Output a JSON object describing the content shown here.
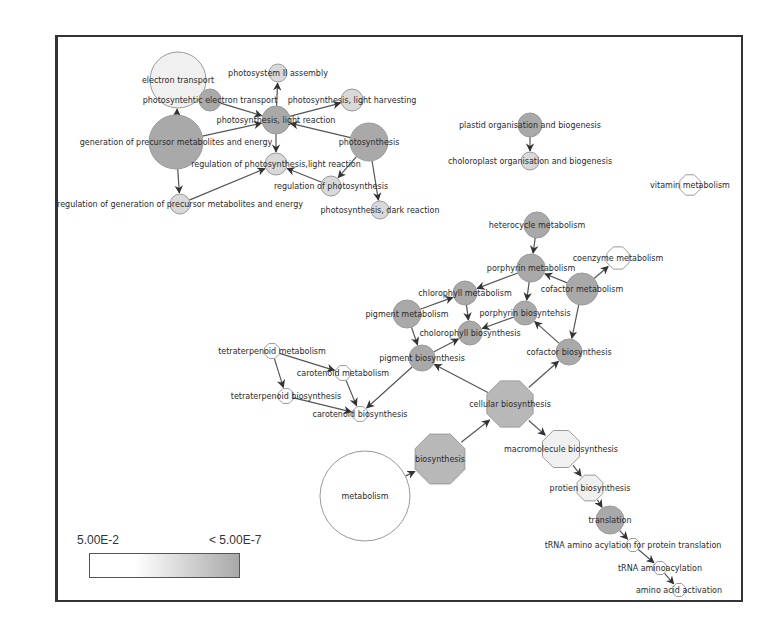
{
  "legend": {
    "low_label": "5.00E-2",
    "high_label": "< 5.00E-7",
    "gradient_start": "#ffffff",
    "gradient_end": "#a8a8a8"
  },
  "colors": {
    "white": "#ffffff",
    "very_light": "#f0f0f0",
    "light": "#d9d9d9",
    "medium": "#b8b8b8",
    "dark": "#a9a9a9"
  },
  "nodes": [
    {
      "id": "electron_transport",
      "label": "electron transport",
      "x": 178,
      "y": 80,
      "r": 28,
      "shade": "very_light",
      "shape": "circle"
    },
    {
      "id": "photosystem_ii_assembly",
      "label": "photosystem II assembly",
      "x": 278,
      "y": 73,
      "r": 9,
      "shade": "light",
      "shape": "circle"
    },
    {
      "id": "photosynthetic_electron_transport",
      "label": "photosyntehtic electron transport",
      "x": 210,
      "y": 100,
      "r": 11,
      "shade": "dark",
      "shape": "circle"
    },
    {
      "id": "photosynthesis_light_harvesting",
      "label": "photosynthesis, light harvesting",
      "x": 352,
      "y": 100,
      "r": 11,
      "shade": "light",
      "shape": "circle"
    },
    {
      "id": "photosynthesis_light_reaction",
      "label": "photosynthesis, light reaction",
      "x": 276,
      "y": 120,
      "r": 14,
      "shade": "dark",
      "shape": "circle"
    },
    {
      "id": "generation_precursor",
      "label": "generation of precursor metabolites and energy",
      "x": 176,
      "y": 142,
      "r": 27,
      "shade": "dark",
      "shape": "circle"
    },
    {
      "id": "photosynthesis",
      "label": "photosynthesis",
      "x": 369,
      "y": 142,
      "r": 19,
      "shade": "dark",
      "shape": "circle"
    },
    {
      "id": "regulation_photosynthesis_light",
      "label": "regulation of photosynthesis,light reaction",
      "x": 276,
      "y": 164,
      "r": 11,
      "shade": "light",
      "shape": "circle"
    },
    {
      "id": "regulation_photosynthesis",
      "label": "regulation of photosynthesis",
      "x": 331,
      "y": 186,
      "r": 10,
      "shade": "light",
      "shape": "circle"
    },
    {
      "id": "regulation_generation_precursor",
      "label": "regulation of generation of precursor metabolites and energy",
      "x": 180,
      "y": 204,
      "r": 10,
      "shade": "light",
      "shape": "circle"
    },
    {
      "id": "photosynthesis_dark_reaction",
      "label": "photosynthesis, dark reaction",
      "x": 380,
      "y": 210,
      "r": 9,
      "shade": "light",
      "shape": "circle"
    },
    {
      "id": "plastid_organisation",
      "label": "plastid organisation and biogenesis",
      "x": 530,
      "y": 125,
      "r": 12,
      "shade": "dark",
      "shape": "circle"
    },
    {
      "id": "chloroplast_organisation",
      "label": "choloroplast organisation and biogenesis",
      "x": 530,
      "y": 161,
      "r": 9,
      "shade": "light",
      "shape": "circle"
    },
    {
      "id": "vitamin_metabolism",
      "label": "vitamin metabolism",
      "x": 690,
      "y": 185,
      "r": 11,
      "shade": "white",
      "shape": "octagon"
    },
    {
      "id": "heterocycle_metabolism",
      "label": "heterocycle metabolism",
      "x": 537,
      "y": 225,
      "r": 13,
      "shade": "dark",
      "shape": "circle"
    },
    {
      "id": "porphyrin_metabolism",
      "label": "porphyrin metabolism",
      "x": 531,
      "y": 268,
      "r": 14,
      "shade": "dark",
      "shape": "circle"
    },
    {
      "id": "coenzyme_metabolism",
      "label": "coenzyme metabolism",
      "x": 618,
      "y": 258,
      "r": 12,
      "shade": "white",
      "shape": "octagon"
    },
    {
      "id": "cofactor_metabolism",
      "label": "cofactor metabolism",
      "x": 582,
      "y": 289,
      "r": 16,
      "shade": "dark",
      "shape": "circle"
    },
    {
      "id": "chlorophyll_metabolism",
      "label": "chlorophyll metabolism",
      "x": 465,
      "y": 293,
      "r": 12,
      "shade": "dark",
      "shape": "circle"
    },
    {
      "id": "pigment_metabolism",
      "label": "pigment metabolism",
      "x": 407,
      "y": 314,
      "r": 14,
      "shade": "dark",
      "shape": "circle"
    },
    {
      "id": "porphyrin_biosynthesis",
      "label": "porphyrin biosyntehsis",
      "x": 525,
      "y": 313,
      "r": 12,
      "shade": "dark",
      "shape": "circle"
    },
    {
      "id": "chlorophyll_biosynthesis",
      "label": "cholorophyll biosynthesis",
      "x": 470,
      "y": 333,
      "r": 12,
      "shade": "dark",
      "shape": "circle"
    },
    {
      "id": "cofactor_biosynthesis",
      "label": "cofactor biosynthesis",
      "x": 569,
      "y": 352,
      "r": 13,
      "shade": "dark",
      "shape": "circle"
    },
    {
      "id": "pigment_biosynthesis",
      "label": "pigment biosynthesis",
      "x": 422,
      "y": 358,
      "r": 13,
      "shade": "dark",
      "shape": "circle"
    },
    {
      "id": "tetraterpenoid_metabolism",
      "label": "tetraterpenoid metabolism",
      "x": 272,
      "y": 351,
      "r": 8,
      "shade": "white",
      "shape": "octagon"
    },
    {
      "id": "carotenoid_metabolism",
      "label": "carotenoid metabolism",
      "x": 343,
      "y": 373,
      "r": 8,
      "shade": "white",
      "shape": "octagon"
    },
    {
      "id": "tetraterpenoid_biosynthesis",
      "label": "tetraterpenoid biosynthesis",
      "x": 286,
      "y": 396,
      "r": 8,
      "shade": "white",
      "shape": "octagon"
    },
    {
      "id": "carotenoid_biosynthesis",
      "label": "carotenoid biosynthesis",
      "x": 360,
      "y": 414,
      "r": 8,
      "shade": "white",
      "shape": "octagon"
    },
    {
      "id": "cellular_biosynthesis",
      "label": "cellular biosynthesis",
      "x": 510,
      "y": 404,
      "r": 25,
      "shade": "medium",
      "shape": "octagon"
    },
    {
      "id": "macromolecule_biosynthesis",
      "label": "macromolecule biosynthesis",
      "x": 561,
      "y": 449,
      "r": 20,
      "shade": "very_light",
      "shape": "octagon"
    },
    {
      "id": "biosynthesis",
      "label": "biosynthesis",
      "x": 440,
      "y": 459,
      "r": 27,
      "shade": "medium",
      "shape": "octagon"
    },
    {
      "id": "metabolism",
      "label": "metabolism",
      "x": 365,
      "y": 496,
      "r": 45,
      "shade": "white",
      "shape": "circle"
    },
    {
      "id": "protein_biosynthesis",
      "label": "protien biosynthesis",
      "x": 590,
      "y": 488,
      "r": 14,
      "shade": "very_light",
      "shape": "octagon"
    },
    {
      "id": "translation",
      "label": "translation",
      "x": 610,
      "y": 520,
      "r": 14,
      "shade": "dark",
      "shape": "circle"
    },
    {
      "id": "trna_aminoacylation_translation",
      "label": "tRNA amino acylation for protein translation",
      "x": 633,
      "y": 545,
      "r": 7,
      "shade": "white",
      "shape": "octagon"
    },
    {
      "id": "trna_aminoacylation",
      "label": "tRNA aminoacylation",
      "x": 660,
      "y": 568,
      "r": 7,
      "shade": "white",
      "shape": "octagon"
    },
    {
      "id": "amino_acid_activation",
      "label": "amino acid activation",
      "x": 679,
      "y": 590,
      "r": 7,
      "shade": "white",
      "shape": "octagon"
    }
  ],
  "edges": [
    [
      "generation_precursor",
      "electron_transport"
    ],
    [
      "electron_transport",
      "photosynthetic_electron_transport"
    ],
    [
      "photosynthetic_electron_transport",
      "photosynthesis_light_reaction"
    ],
    [
      "generation_precursor",
      "photosynthesis_light_reaction"
    ],
    [
      "photosynthesis_light_reaction",
      "photosystem_ii_assembly"
    ],
    [
      "photosynthesis_light_reaction",
      "photosynthesis_light_harvesting"
    ],
    [
      "photosynthesis",
      "photosynthesis_light_reaction"
    ],
    [
      "photosynthesis_light_reaction",
      "regulation_photosynthesis_light"
    ],
    [
      "generation_precursor",
      "regulation_generation_precursor"
    ],
    [
      "regulation_generation_precursor",
      "regulation_photosynthesis_light"
    ],
    [
      "regulation_photosynthesis",
      "regulation_photosynthesis_light"
    ],
    [
      "photosynthesis",
      "regulation_photosynthesis"
    ],
    [
      "photosynthesis",
      "photosynthesis_dark_reaction"
    ],
    [
      "plastid_organisation",
      "chloroplast_organisation"
    ],
    [
      "heterocycle_metabolism",
      "porphyrin_metabolism"
    ],
    [
      "porphyrin_metabolism",
      "chlorophyll_metabolism"
    ],
    [
      "porphyrin_metabolism",
      "porphyrin_biosynthesis"
    ],
    [
      "cofactor_metabolism",
      "porphyrin_metabolism"
    ],
    [
      "cofactor_metabolism",
      "coenzyme_metabolism"
    ],
    [
      "cofactor_metabolism",
      "cofactor_biosynthesis"
    ],
    [
      "pigment_metabolism",
      "chlorophyll_metabolism"
    ],
    [
      "chlorophyll_metabolism",
      "chlorophyll_biosynthesis"
    ],
    [
      "porphyrin_biosynthesis",
      "chlorophyll_biosynthesis"
    ],
    [
      "pigment_metabolism",
      "pigment_biosynthesis"
    ],
    [
      "pigment_biosynthesis",
      "chlorophyll_biosynthesis"
    ],
    [
      "cofactor_biosynthesis",
      "porphyrin_biosynthesis"
    ],
    [
      "cellular_biosynthesis",
      "cofactor_biosynthesis"
    ],
    [
      "cellular_biosynthesis",
      "pigment_biosynthesis"
    ],
    [
      "pigment_biosynthesis",
      "carotenoid_biosynthesis"
    ],
    [
      "tetraterpenoid_metabolism",
      "carotenoid_metabolism"
    ],
    [
      "tetraterpenoid_metabolism",
      "tetraterpenoid_biosynthesis"
    ],
    [
      "carotenoid_metabolism",
      "carotenoid_biosynthesis"
    ],
    [
      "tetraterpenoid_biosynthesis",
      "carotenoid_biosynthesis"
    ],
    [
      "biosynthesis",
      "cellular_biosynthesis"
    ],
    [
      "metabolism",
      "biosynthesis"
    ],
    [
      "cellular_biosynthesis",
      "macromolecule_biosynthesis"
    ],
    [
      "macromolecule_biosynthesis",
      "protein_biosynthesis"
    ],
    [
      "protein_biosynthesis",
      "translation"
    ],
    [
      "translation",
      "trna_aminoacylation_translation"
    ],
    [
      "trna_aminoacylation_translation",
      "trna_aminoacylation"
    ],
    [
      "trna_aminoacylation",
      "amino_acid_activation"
    ]
  ]
}
